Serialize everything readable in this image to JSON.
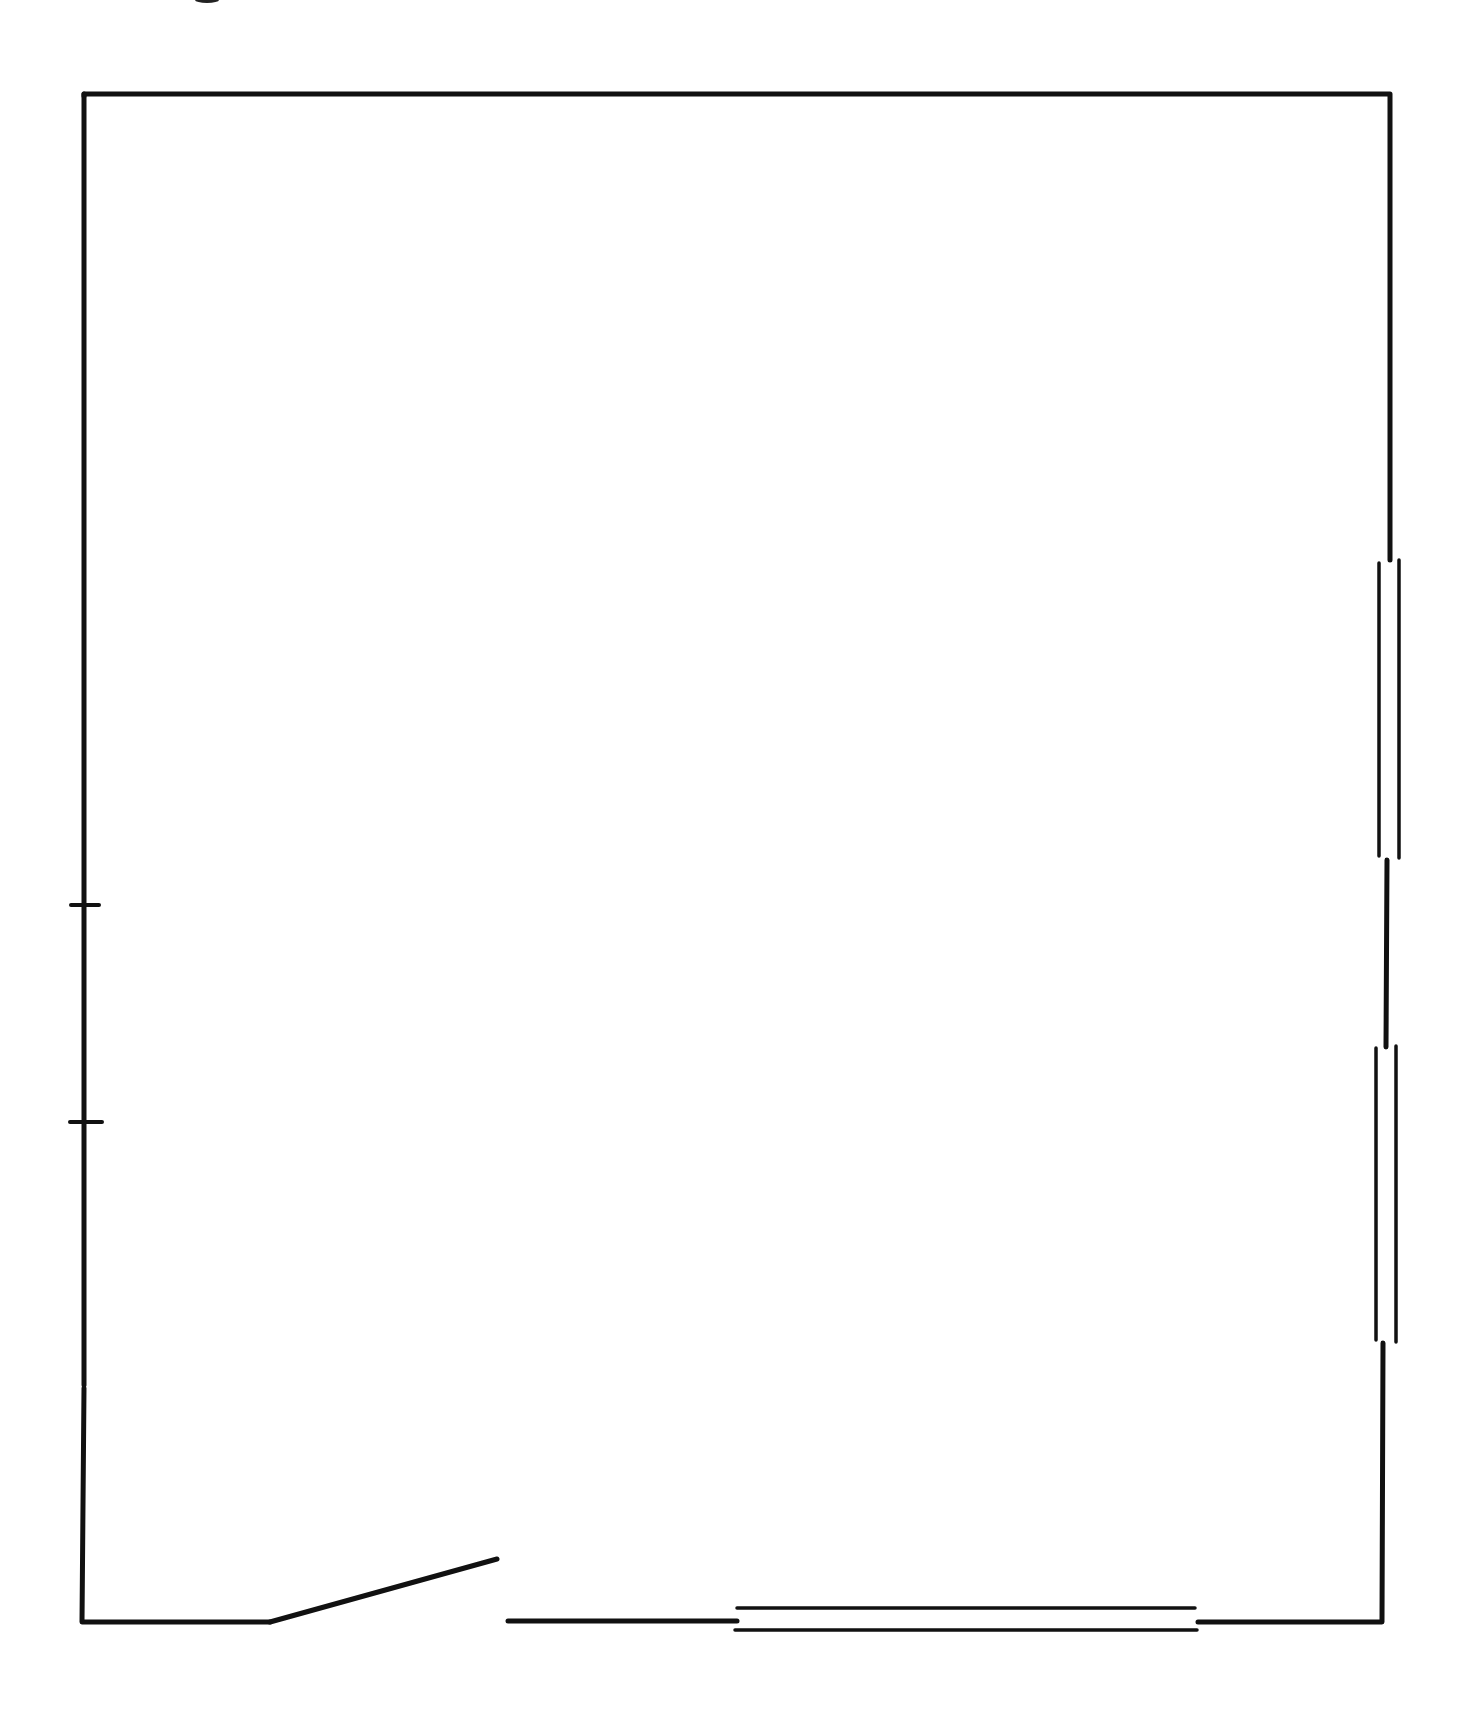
{
  "diagram": {
    "type": "floor-plan",
    "colors": {
      "background": "#ffffff",
      "line": "#111111"
    },
    "room": {
      "outline_corners": [
        [
          84,
          94
        ],
        [
          1390,
          94
        ],
        [
          1382,
          1622
        ],
        [
          82,
          1622
        ]
      ]
    },
    "windows": [
      {
        "id": "right-window-upper",
        "wall": "right",
        "from_y": 560,
        "to_y": 858
      },
      {
        "id": "right-window-lower",
        "wall": "right",
        "from_y": 1045,
        "to_y": 1340
      },
      {
        "id": "bottom-window",
        "wall": "bottom",
        "from_x": 735,
        "to_x": 1197
      }
    ],
    "door": {
      "id": "front-door",
      "wall": "bottom",
      "hinge": [
        270,
        1622
      ],
      "leaf_end": [
        497,
        1559
      ],
      "opening_to_x": 508
    },
    "wall_ticks": [
      {
        "id": "left-tick-upper",
        "wall": "left",
        "y": 905
      },
      {
        "id": "left-tick-lower",
        "wall": "left",
        "y": 1122
      }
    ]
  }
}
